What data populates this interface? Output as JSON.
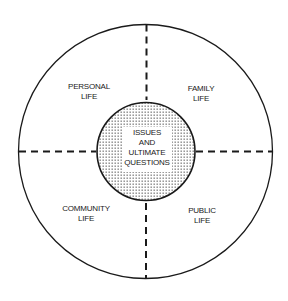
{
  "diagram": {
    "type": "concentric-quadrant",
    "center": {
      "lines": [
        "ISSUES",
        "AND",
        "ULTIMATE",
        "QUESTIONS"
      ],
      "fill": "dotted"
    },
    "quadrants": [
      {
        "position": "top-left",
        "lines": [
          "PERSONAL",
          "LIFE"
        ]
      },
      {
        "position": "top-right",
        "lines": [
          "FAMILY",
          "LIFE"
        ]
      },
      {
        "position": "bottom-left",
        "lines": [
          "COMMUNITY",
          "LIFE"
        ]
      },
      {
        "position": "bottom-right",
        "lines": [
          "PUBLIC",
          "LIFE"
        ]
      }
    ],
    "colors": {
      "stroke": "#1a1a1a",
      "background": "#ffffff",
      "dots": "#333333"
    }
  }
}
